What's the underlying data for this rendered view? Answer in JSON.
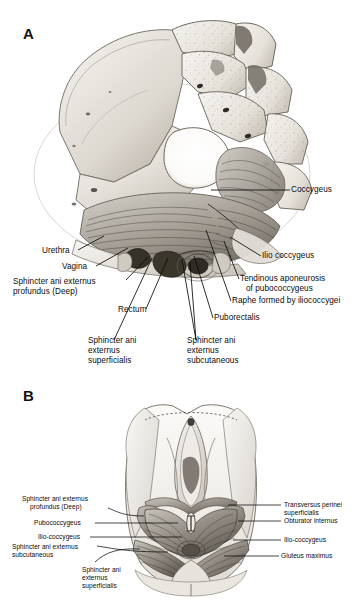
{
  "figure": {
    "background": "#ffffff",
    "panels": [
      {
        "id": "A",
        "letter": "A",
        "caption_view": "Superior (pelvic) view of female pelvic floor musculature, hemisected pelvis",
        "labels": [
          {
            "name": "coccygeus",
            "text": "Coccygeus",
            "side": "right"
          },
          {
            "name": "ilio-coccygeus",
            "text": "Ilio coccygeus",
            "side": "right"
          },
          {
            "name": "tendinous-aponeurosis-line1",
            "text": "Tendinous aponeurosis",
            "side": "right"
          },
          {
            "name": "tendinous-aponeurosis-line2",
            "text": "of pubococcygeus",
            "side": "right"
          },
          {
            "name": "raphe-iliococcygei",
            "text": "Raphe formed by iliococcygei",
            "side": "right"
          },
          {
            "name": "puborectalis",
            "text": "Puborectalis",
            "side": "right"
          },
          {
            "name": "urethra",
            "text": "Urethra",
            "side": "left"
          },
          {
            "name": "vagina",
            "text": "Vagina",
            "side": "left"
          },
          {
            "name": "sphincter-ani-externus-profundus-line1",
            "text": "Sphincter ani externus",
            "side": "left"
          },
          {
            "name": "sphincter-ani-externus-profundus-line2",
            "text": "profundus (Deep)",
            "side": "left"
          },
          {
            "name": "rectum",
            "text": "Rectum",
            "side": "left"
          },
          {
            "name": "sphincter-ani-externus-superficialis",
            "text": "Sphincter ani\nexternus\nsuperficialis",
            "side": "bottom"
          },
          {
            "name": "sphincter-ani-externus-subcutaneous",
            "text": "Sphincter ani\nexternus\nsubcutaneous",
            "side": "bottom"
          }
        ]
      },
      {
        "id": "B",
        "letter": "B",
        "caption_view": "Inferior (perineal) view of female pelvic floor and perineum",
        "labels": [
          {
            "name": "sphincter-ani-externus-profundus-line1",
            "text": "Sphincter ani externus",
            "side": "left"
          },
          {
            "name": "sphincter-ani-externus-profundus-line2",
            "text": "profundus (Deep)",
            "side": "left"
          },
          {
            "name": "pubococcygeus",
            "text": "Pubococcygeus",
            "side": "left"
          },
          {
            "name": "ilio-coccygeus-left",
            "text": "Ilio-coccygeus",
            "side": "left"
          },
          {
            "name": "sphincter-ani-externus-subcutaneous-line1",
            "text": "Sphincter ani externus",
            "side": "left"
          },
          {
            "name": "sphincter-ani-externus-subcutaneous-line2",
            "text": "subcutaneous",
            "side": "left"
          },
          {
            "name": "sphincter-ani-externus-superficialis",
            "text": "Sphincter ani\nexternus\nsuperficialis",
            "side": "bottom"
          },
          {
            "name": "transversus-perinei-line1",
            "text": "Transversus perinei",
            "side": "right"
          },
          {
            "name": "transversus-perinei-line2",
            "text": "superficialis",
            "side": "right"
          },
          {
            "name": "obturator-internus",
            "text": "Obturator internus",
            "side": "right"
          },
          {
            "name": "ilio-coccygeus-right",
            "text": "Ilio-coccygeus",
            "side": "right"
          },
          {
            "name": "gluteus-maximus",
            "text": "Gluteus maximus",
            "side": "right"
          }
        ]
      }
    ]
  },
  "panelA": {
    "letter": "A",
    "coccygeus": "Coccygeus",
    "ilio_coccygeus": "Ilio coccygeus",
    "tendinous_aponeurosis_1": "Tendinous aponeurosis",
    "tendinous_aponeurosis_2": "of pubococcygeus",
    "raphe": "Raphe formed by iliococcygei",
    "puborectalis": "Puborectalis",
    "urethra": "Urethra",
    "vagina": "Vagina",
    "sae_profundus_1": "Sphincter ani externus",
    "sae_profundus_2": "profundus (Deep)",
    "rectum": "Rectum",
    "sae_superficialis_1": "Sphincter ani",
    "sae_superficialis_2": "externus",
    "sae_superficialis_3": "superficialis",
    "sae_subcutaneous_1": "Sphincter ani",
    "sae_subcutaneous_2": "externus",
    "sae_subcutaneous_3": "subcutaneous"
  },
  "panelB": {
    "letter": "B",
    "sae_profundus_1": "Sphincter ani externus",
    "sae_profundus_2": "profundus (Deep)",
    "pubococcygeus": "Pubococcygeus",
    "ilio_coccygeus_left": "Ilio-coccygeus",
    "sae_subcutaneous_1": "Sphincter ani externus",
    "sae_subcutaneous_2": "subcutaneous",
    "sae_superficialis_1": "Sphincter ani",
    "sae_superficialis_2": "externus",
    "sae_superficialis_3": "superficialis",
    "transversus_perinei_1": "Transversus perinei",
    "transversus_perinei_2": "superficialis",
    "obturator_internus": "Obturator internus",
    "ilio_coccygeus_right": "Ilio-coccygeus",
    "gluteus_maximus": "Gluteus maximus"
  },
  "colors": {
    "background": "#ffffff",
    "ink": "#0a0a0a",
    "bone_light": "#f2f0ec",
    "bone_mid": "#d8d4cc",
    "bone_shadow": "#a9a49a",
    "muscle_light": "#d9d6d0",
    "muscle_mid": "#9b958c",
    "muscle_dark": "#5d5851",
    "cavity_dark": "#3a3733"
  }
}
